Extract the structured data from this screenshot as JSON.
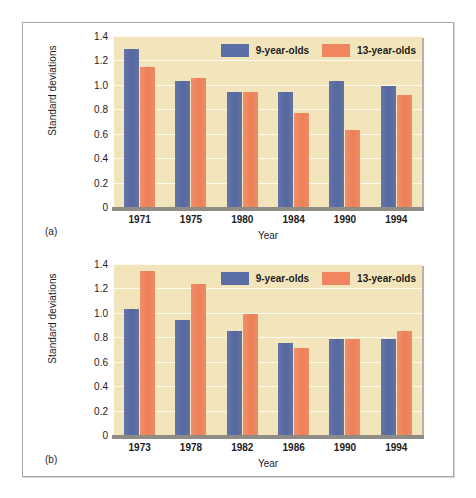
{
  "figure": {
    "panels": [
      {
        "tag": "(a)",
        "xlabel": "Year",
        "ylabel": "Standard deviations"
      },
      {
        "tag": "(b)",
        "xlabel": "Year",
        "ylabel": "Standard deviations"
      }
    ]
  },
  "colors": {
    "series_9": "#5b6ea6",
    "series_13": "#ef8660",
    "plot_background": "#f3e5bb",
    "gridline": "#fdfaf0",
    "axis": "#8f8c85",
    "frame_border": "#a8a8a8"
  },
  "chart_data": [
    {
      "type": "bar",
      "title": "(a)",
      "xlabel": "Year",
      "ylabel": "Standard deviations",
      "categories": [
        "1971",
        "1975",
        "1980",
        "1984",
        "1990",
        "1994"
      ],
      "series": [
        {
          "name": "9-year-olds",
          "values": [
            1.29,
            1.03,
            0.94,
            0.94,
            1.03,
            0.99
          ]
        },
        {
          "name": "13-year-olds",
          "values": [
            1.15,
            1.06,
            0.94,
            0.77,
            0.63,
            0.92
          ]
        }
      ],
      "ylim": [
        0,
        1.4
      ],
      "yticks": [
        "0",
        "0.2",
        "0.4",
        "0.6",
        "0.8",
        "1.0",
        "1.2",
        "1.4"
      ],
      "grid": true,
      "legend_position": "top-right"
    },
    {
      "type": "bar",
      "title": "(b)",
      "xlabel": "Year",
      "ylabel": "Standard deviations",
      "categories": [
        "1973",
        "1978",
        "1982",
        "1986",
        "1990",
        "1994"
      ],
      "series": [
        {
          "name": "9-year-olds",
          "values": [
            1.03,
            0.94,
            0.85,
            0.75,
            0.79,
            0.79
          ]
        },
        {
          "name": "13-year-olds",
          "values": [
            1.34,
            1.24,
            0.99,
            0.71,
            0.79,
            0.85
          ]
        }
      ],
      "ylim": [
        0,
        1.4
      ],
      "yticks": [
        "0",
        "0.2",
        "0.4",
        "0.6",
        "0.8",
        "1.0",
        "1.2",
        "1.4"
      ],
      "grid": true,
      "legend_position": "top-right"
    }
  ]
}
